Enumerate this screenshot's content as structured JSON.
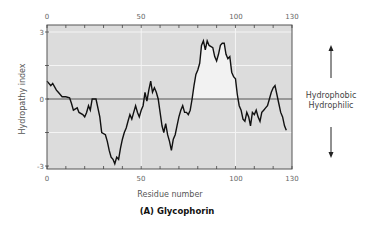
{
  "chart_data": {
    "type": "line",
    "title": "(A) Glycophorin",
    "xlabel": "Residue number",
    "ylabel": "Hydropathy index",
    "xlim": [
      0,
      130
    ],
    "ylim": [
      -3,
      3
    ],
    "x_ticks_labeled": [
      0,
      50,
      100,
      130
    ],
    "y_ticks_labeled": [
      3,
      0,
      -3
    ],
    "x_minor_ticks_every": 10,
    "grid": true,
    "zero_line": true,
    "fill_above_zero_region": [
      77,
      101
    ],
    "annotations": {
      "up_label": "Hydrophobic",
      "down_label": "Hydrophilic"
    },
    "series": [
      {
        "name": "Glycophorin hydropathy",
        "x": [
          0,
          2,
          3,
          5,
          6,
          8,
          10,
          12,
          13,
          14,
          16,
          17,
          19,
          20,
          21,
          22,
          23,
          24,
          26,
          28,
          29,
          31,
          32,
          33,
          34,
          35,
          36,
          37,
          38,
          39,
          40,
          41,
          42,
          43,
          44,
          45,
          46,
          47,
          48,
          49,
          50,
          51,
          52,
          53,
          54,
          55,
          56,
          57,
          58,
          59,
          60,
          61,
          62,
          63,
          64,
          65,
          66,
          67,
          68,
          69,
          70,
          71,
          72,
          73,
          74,
          75,
          76,
          77,
          78,
          79,
          80,
          81,
          82,
          83,
          84,
          85,
          86,
          88,
          89,
          90,
          91,
          92,
          93,
          94,
          95,
          96,
          97,
          98,
          99,
          100,
          101,
          102,
          103,
          104,
          105,
          106,
          107,
          108,
          109,
          110,
          111,
          112,
          113,
          114,
          115,
          116,
          117,
          118,
          119,
          120,
          121,
          122,
          123,
          124,
          125,
          126,
          127
        ],
        "values": [
          0.8,
          0.6,
          0.7,
          0.4,
          0.3,
          0.1,
          0.1,
          0.05,
          -0.2,
          -0.5,
          -0.4,
          -0.6,
          -0.7,
          -0.8,
          -0.6,
          -0.3,
          -0.5,
          0,
          0,
          -0.8,
          -1.5,
          -1.6,
          -1.9,
          -2.3,
          -2.6,
          -2.7,
          -2.9,
          -2.6,
          -2.7,
          -2.2,
          -1.8,
          -1.5,
          -1.3,
          -1.0,
          -0.7,
          -0.9,
          -0.6,
          -0.3,
          -0.6,
          -0.8,
          -0.5,
          -0.3,
          0.3,
          -0.1,
          0.4,
          0.8,
          0.3,
          0.5,
          0.3,
          0,
          -0.6,
          -1.2,
          -1.5,
          -1.1,
          -1.6,
          -1.9,
          -2.3,
          -1.8,
          -1.6,
          -1.2,
          -0.8,
          -0.5,
          -0.3,
          -0.6,
          -0.6,
          -0.7,
          -0.5,
          0,
          0.6,
          1.1,
          1.3,
          1.6,
          2.4,
          2.6,
          2.2,
          2.6,
          2.4,
          2.3,
          1.9,
          1.7,
          2.0,
          2.4,
          2.5,
          2.5,
          2.0,
          1.8,
          1.9,
          1.2,
          1.0,
          0.9,
          0.2,
          -0.3,
          -0.5,
          -0.9,
          -1.0,
          -0.6,
          -0.8,
          -1.2,
          -0.6,
          -0.7,
          -0.5,
          -0.8,
          -1.0,
          -0.6,
          -0.5,
          -0.4,
          -0.3,
          0,
          0.3,
          0.5,
          0.6,
          0.2,
          -0.2,
          -0.6,
          -0.8,
          -1.2,
          -1.4
        ]
      }
    ]
  },
  "colors": {
    "plot_bg": "#dcdcdc",
    "grid": "#f4f4f4",
    "line": "#111111",
    "fill": "#f2f2f2",
    "axis": "#555555"
  },
  "labels": {
    "x_tick_0": "0",
    "x_tick_50": "50",
    "x_tick_100": "100",
    "x_tick_130": "130",
    "y_tick_3": "3",
    "y_tick_0": "0",
    "y_tick_m3": "-3",
    "xlabel": "Residue number",
    "ylabel": "Hydropathy index",
    "hydrophobic": "Hydrophobic",
    "hydrophilic": "Hydrophilic",
    "caption": "(A) Glycophorin"
  }
}
